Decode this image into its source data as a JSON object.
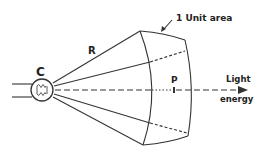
{
  "diagram": {
    "source_label": "C",
    "distance_label": "R",
    "area_label": "1 Unit area",
    "point_label": "P",
    "energy_label_line1": "Light",
    "energy_label_line2": "energy",
    "stroke_color": "#333333",
    "background_color": "#ffffff"
  }
}
